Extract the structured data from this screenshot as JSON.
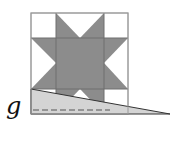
{
  "diagram": {
    "label": "g",
    "colors": {
      "star_fill": "#8c8c8c",
      "light_triangle_fill": "#d4d4d4",
      "grid_stroke": "#9a9a9a",
      "edge_stroke": "#333333",
      "background": "#ffffff"
    },
    "square": {
      "x0": 31,
      "y0": 13,
      "x1": 128,
      "y1": 114
    },
    "grid": {
      "xs": [
        56,
        104
      ],
      "ys": [
        38,
        89
      ]
    },
    "triangle": {
      "points": [
        [
          31,
          89
        ],
        [
          170,
          114
        ],
        [
          31,
          114
        ]
      ]
    },
    "dashed_line": {
      "x0": 33,
      "x1": 110,
      "y": 110
    }
  }
}
